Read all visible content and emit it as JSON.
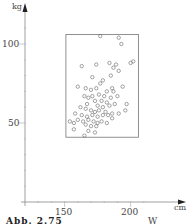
{
  "chart_data": {
    "type": "scatter",
    "title": "",
    "xlabel": "cm",
    "ylabel": "kg",
    "xlim": [
      120,
      215
    ],
    "ylim": [
      0,
      115
    ],
    "x_ticks": [
      150,
      200
    ],
    "y_ticks": [
      50,
      100
    ],
    "x_minor_step": 10,
    "y_minor_step": 10,
    "grid": false,
    "legend": null,
    "marker": "open-circle",
    "bounding_box": {
      "x_min": 151,
      "x_max": 206,
      "y_min": 41,
      "y_max": 106
    },
    "points": [
      [
        177,
        105
      ],
      [
        191,
        104
      ],
      [
        193,
        100
      ],
      [
        187,
        85
      ],
      [
        200,
        88
      ],
      [
        163,
        86
      ],
      [
        174,
        87
      ],
      [
        184,
        88
      ],
      [
        189,
        87
      ],
      [
        191,
        83
      ],
      [
        202,
        89
      ],
      [
        185,
        80
      ],
      [
        171,
        79
      ],
      [
        179,
        77
      ],
      [
        177,
        75
      ],
      [
        186,
        72
      ],
      [
        160,
        73
      ],
      [
        166,
        72
      ],
      [
        170,
        71
      ],
      [
        174,
        72
      ],
      [
        182,
        70
      ],
      [
        187,
        70
      ],
      [
        194,
        73
      ],
      [
        165,
        67
      ],
      [
        168,
        66
      ],
      [
        171,
        67
      ],
      [
        176,
        68
      ],
      [
        180,
        67
      ],
      [
        185,
        66
      ],
      [
        190,
        67
      ],
      [
        173,
        64
      ],
      [
        178,
        64
      ],
      [
        182,
        63
      ],
      [
        167,
        62
      ],
      [
        175,
        61
      ],
      [
        179,
        60
      ],
      [
        184,
        61
      ],
      [
        188,
        62
      ],
      [
        197,
        62
      ],
      [
        162,
        60
      ],
      [
        166,
        59
      ],
      [
        170,
        58
      ],
      [
        173,
        57
      ],
      [
        176,
        58
      ],
      [
        181,
        57
      ],
      [
        158,
        56
      ],
      [
        163,
        55
      ],
      [
        167,
        54
      ],
      [
        171,
        55
      ],
      [
        175,
        54
      ],
      [
        179,
        55
      ],
      [
        183,
        55
      ],
      [
        186,
        56
      ],
      [
        160,
        52
      ],
      [
        164,
        51
      ],
      [
        168,
        52
      ],
      [
        172,
        51
      ],
      [
        175,
        50
      ],
      [
        178,
        51
      ],
      [
        182,
        50
      ],
      [
        154,
        51
      ],
      [
        157,
        50
      ],
      [
        166,
        49
      ],
      [
        170,
        48
      ],
      [
        174,
        48
      ],
      [
        168,
        45
      ],
      [
        173,
        44
      ],
      [
        165,
        42
      ],
      [
        196,
        58
      ],
      [
        191,
        56
      ],
      [
        186,
        53
      ],
      [
        157,
        46
      ]
    ]
  },
  "axes": {
    "y_unit": "kg",
    "x_unit": "cm",
    "y_labels": [
      "100",
      "50"
    ],
    "x_labels": [
      "150",
      "200"
    ]
  },
  "caption": {
    "left": "Abb. 2.75",
    "right": "W"
  }
}
